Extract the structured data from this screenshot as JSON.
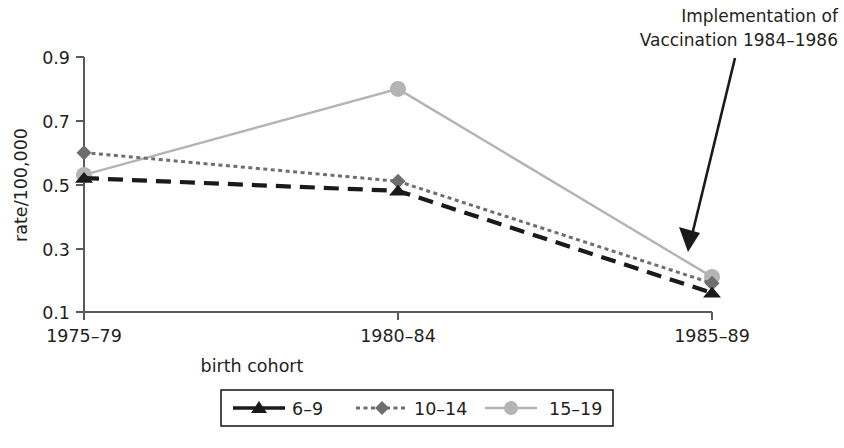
{
  "chart_data": {
    "type": "line",
    "title": "",
    "xlabel": "birth cohort",
    "ylabel": "rate/100,000",
    "categories": [
      "1975–79",
      "1980–84",
      "1985–89"
    ],
    "ylim": [
      0.1,
      0.9
    ],
    "yticks": [
      0.9,
      0.7,
      0.5,
      0.3,
      0.1
    ],
    "ytick_labels": [
      "0.9",
      "0.7",
      "0.5",
      "0.3",
      "0.1"
    ],
    "grid": false,
    "legend_position": "bottom",
    "series": [
      {
        "name": "6–9",
        "values": [
          0.52,
          0.48,
          0.16
        ],
        "color": "#1a1a1a",
        "line_style": "dashed",
        "marker": "triangle"
      },
      {
        "name": "10–14",
        "values": [
          0.6,
          0.51,
          0.19
        ],
        "color": "#6e6e6e",
        "line_style": "dotted",
        "marker": "diamond"
      },
      {
        "name": "15–19",
        "values": [
          0.53,
          0.8,
          0.21
        ],
        "color": "#b4b4b4",
        "line_style": "solid",
        "marker": "circle"
      }
    ],
    "annotations": [
      {
        "text_line_1": "Implementation of",
        "text_line_2": "Vaccination 1984–1986",
        "arrow": "points-down-left-to-1985-89-cluster"
      }
    ]
  },
  "axes": {
    "y_axis_title": "rate/100,000",
    "x_axis_title": "birth cohort",
    "y_tick_0": "0.9",
    "y_tick_1": "0.7",
    "y_tick_2": "0.5",
    "y_tick_3": "0.3",
    "y_tick_4": "0.1",
    "x_cat_0": "1975–79",
    "x_cat_1": "1980–84",
    "x_cat_2": "1985–89"
  },
  "annotation": {
    "line1": "Implementation of",
    "line2": "Vaccination 1984–1986"
  },
  "legend": {
    "items": [
      {
        "label": "6–9"
      },
      {
        "label": "10–14"
      },
      {
        "label": "15–19"
      }
    ]
  },
  "colors": {
    "series_6_9": "#1a1a1a",
    "series_10_14": "#6e6e6e",
    "series_15_19": "#b4b4b4",
    "axis": "#5a5a5a",
    "text": "#231f20",
    "background": "#ffffff"
  }
}
